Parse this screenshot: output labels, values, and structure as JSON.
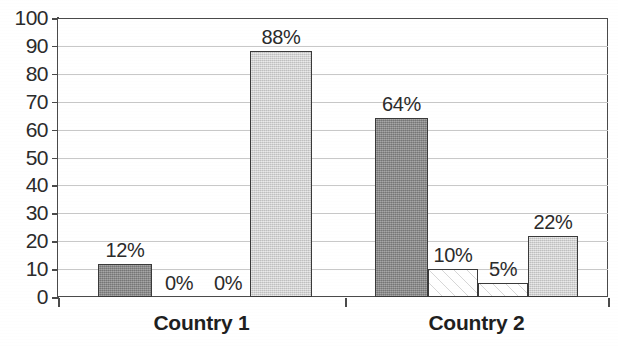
{
  "chart_data": {
    "type": "bar",
    "title": "",
    "subtitle": "",
    "xlabel": "",
    "ylabel": "",
    "categories": [
      "Country 1",
      "Country 2"
    ],
    "ylim": [
      0,
      100
    ],
    "yticks": [
      0,
      10,
      20,
      30,
      40,
      50,
      60,
      70,
      80,
      90,
      100
    ],
    "ytick_labels": [
      "0",
      "10",
      "20",
      "30",
      "40",
      "50",
      "60",
      "70",
      "80",
      "90",
      "100"
    ],
    "grid": true,
    "legend": "none",
    "value_suffix": "%",
    "series": [
      {
        "name": "series-1",
        "fill": "dark-gray",
        "color": "#8e8e8e",
        "values": [
          12,
          64
        ],
        "labels": [
          "12%",
          "64%"
        ]
      },
      {
        "name": "series-2",
        "fill": "white-hatch",
        "color": "#ffffff",
        "values": [
          0,
          10
        ],
        "labels": [
          "0%",
          "10%"
        ]
      },
      {
        "name": "series-3",
        "fill": "white-hatch",
        "color": "#ffffff",
        "values": [
          0,
          5
        ],
        "labels": [
          "0%",
          "5%"
        ]
      },
      {
        "name": "series-4",
        "fill": "light-gray",
        "color": "#d8d8d8",
        "values": [
          88,
          22
        ],
        "labels": [
          "88%",
          "22%"
        ]
      }
    ],
    "bars": [
      {
        "group": "Country 1",
        "series": "series-1",
        "value": 12,
        "label": "12%",
        "fill": "dark",
        "x": 98,
        "w": 54
      },
      {
        "group": "Country 1",
        "series": "series-2",
        "value": 0,
        "label": "0%",
        "fill": "hatch",
        "x": 152,
        "w": 54
      },
      {
        "group": "Country 1",
        "series": "series-3",
        "value": 0,
        "label": "0%",
        "fill": "hatch",
        "x": 206,
        "w": 44
      },
      {
        "group": "Country 1",
        "series": "series-4",
        "value": 88,
        "label": "88%",
        "fill": "light",
        "x": 250,
        "w": 62
      },
      {
        "group": "Country 2",
        "series": "series-1",
        "value": 64,
        "label": "64%",
        "fill": "dark",
        "x": 375,
        "w": 53
      },
      {
        "group": "Country 2",
        "series": "series-2",
        "value": 10,
        "label": "10%",
        "fill": "hatch",
        "x": 428,
        "w": 50
      },
      {
        "group": "Country 2",
        "series": "series-3",
        "value": 5,
        "label": "5%",
        "fill": "hatch",
        "x": 478,
        "w": 50
      },
      {
        "group": "Country 2",
        "series": "series-4",
        "value": 22,
        "label": "22%",
        "fill": "light",
        "x": 528,
        "w": 50
      }
    ],
    "axis": {
      "colors": {
        "axis_line": "#4a4a4a",
        "gridline": "#c8c8c8",
        "text": "#2b2b2b",
        "bar_outline": "#3a3a3a"
      }
    }
  }
}
